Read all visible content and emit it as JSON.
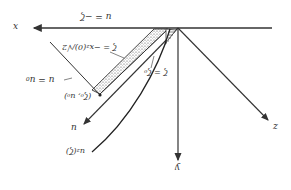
{
  "diagram": {
    "orientation": "rotated-180",
    "axes": {
      "x": {
        "label": "x"
      },
      "y": {
        "label": "y"
      },
      "z": {
        "label": "z"
      },
      "u": {
        "label": "u"
      }
    },
    "labels": {
      "u_eq_neg_zeta": "u = −ζ",
      "zeta_eq": "ζ = −x₂(0)/√2",
      "u_eq_u0": "u = u₀",
      "point": "(ζ₀, u₀)",
      "zeta_eq_zeta0": "ζ = ζ₀",
      "curve": "u₂(ζ)"
    },
    "colors": {
      "line": "#333333",
      "background": "#ffffff"
    }
  }
}
